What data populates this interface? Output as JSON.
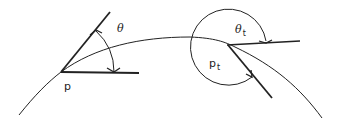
{
  "diagram": {
    "type": "geometry-curve-tangent-angles",
    "stroke_color": "#222222",
    "background": "#ffffff",
    "labels": {
      "point_p": "p",
      "angle_theta": "θ",
      "point_pt_base": "p",
      "point_pt_sub": "t",
      "angle_theta_t_base": "θ",
      "angle_theta_t_sub": "t"
    },
    "points": {
      "p": {
        "x": 61,
        "y": 72
      },
      "p_t": {
        "x": 227,
        "y": 45
      }
    }
  }
}
